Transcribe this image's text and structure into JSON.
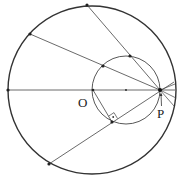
{
  "diagram": {
    "type": "geometry",
    "labels": {
      "center": "O",
      "point": "P"
    },
    "stroke_color": "#333333",
    "large_circle": {
      "cx": 92,
      "cy": 90,
      "r": 84
    },
    "small_circle": {
      "cx": 126,
      "cy": 90,
      "r": 34
    },
    "center_dot": {
      "x": 126,
      "y": 90
    },
    "P": {
      "x": 160,
      "y": 90
    },
    "chords": [
      {
        "from": [
          87,
          5
        ],
        "to": [
          160,
          90
        ],
        "midpoint": [
          130,
          56
        ]
      },
      {
        "from": [
          30,
          34
        ],
        "to": [
          160,
          90
        ],
        "midpoint": [
          103,
          66
        ]
      },
      {
        "from": [
          8,
          90
        ],
        "to": [
          160,
          90
        ],
        "midpoint": [
          93,
          90
        ]
      },
      {
        "from": [
          49,
          164
        ],
        "to": [
          160,
          90
        ],
        "midpoint": [
          112,
          122
        ]
      }
    ],
    "short_chords_to_right": [
      [
        174,
        80
      ],
      [
        176,
        90
      ],
      [
        175,
        99
      ],
      [
        173,
        107
      ]
    ],
    "perpendicular": {
      "from": [
        93,
        90
      ],
      "to": [
        112,
        122
      ],
      "right_angle_mark": true
    }
  }
}
